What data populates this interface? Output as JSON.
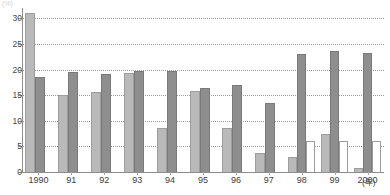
{
  "chart_data": {
    "type": "bar",
    "title": "",
    "subtitle": "",
    "xlabel": "",
    "ylabel": "",
    "y_unit_note": "(%)",
    "x_unit_note": "(年)",
    "categories": [
      "1990",
      "91",
      "92",
      "93",
      "94",
      "95",
      "96",
      "97",
      "98",
      "99",
      "2000"
    ],
    "ylim": [
      0,
      32
    ],
    "yticks": [
      0,
      5,
      10,
      15,
      20,
      25,
      30
    ],
    "ytick_labels": [
      "0",
      "5",
      "10",
      "15",
      "20",
      "25",
      "30"
    ],
    "grid": true,
    "grid_axis": "y",
    "legend": "none",
    "series": [
      {
        "name": "series-1",
        "color": "#b9b9b9",
        "values": [
          31.0,
          15.0,
          15.7,
          19.3,
          8.6,
          15.9,
          8.6,
          3.7,
          2.9,
          7.4,
          0.7
        ]
      },
      {
        "name": "series-2",
        "color": "#8e8e8e",
        "values": [
          18.5,
          19.5,
          19.2,
          19.8,
          19.7,
          16.3,
          17.0,
          13.5,
          23.1,
          23.6,
          23.3
        ]
      },
      {
        "name": "series-3",
        "color": "#ffffff",
        "values": [
          null,
          null,
          null,
          null,
          null,
          null,
          null,
          null,
          6.1,
          6.0,
          6.0
        ]
      }
    ]
  },
  "axis": {
    "y_top_note": "(%)",
    "x_right_note": "(年)"
  }
}
